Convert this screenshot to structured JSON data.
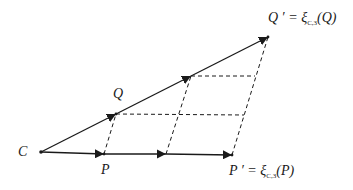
{
  "diagram": {
    "title": "",
    "colors": {
      "stroke": "#1a1a1a",
      "background": "#ffffff"
    },
    "points": {
      "C": {
        "label": "C",
        "x": 41,
        "y": 152
      },
      "P": {
        "label": "P",
        "x": 104,
        "y": 154
      },
      "P2": {
        "label": "",
        "x": 166,
        "y": 154
      },
      "P_prime": {
        "label": "P ′",
        "x": 232,
        "y": 155
      },
      "Q": {
        "label": "Q",
        "x": 116,
        "y": 114
      },
      "Q2": {
        "label": "",
        "x": 191,
        "y": 76
      },
      "Q_prime": {
        "label": "Q ′",
        "x": 268,
        "y": 37
      }
    },
    "labels": {
      "C": "C",
      "P": "P",
      "Q": "Q",
      "P_prime_lhs": "P ′ = ",
      "P_prime_xi": "ξ",
      "P_prime_sub": "C,3",
      "P_prime_arg": "(P)",
      "Q_prime_lhs": "Q ′ = ",
      "Q_prime_xi": "ξ",
      "Q_prime_sub": "C,3",
      "Q_prime_arg": "(Q)"
    },
    "edges": [
      {
        "from": "C",
        "to": "P",
        "style": "solid",
        "arrow": true
      },
      {
        "from": "P",
        "to": "P2",
        "style": "solid",
        "arrow": true
      },
      {
        "from": "P2",
        "to": "P_prime",
        "style": "solid",
        "arrow": true
      },
      {
        "from": "C",
        "to": "Q",
        "style": "solid",
        "arrow": true
      },
      {
        "from": "Q",
        "to": "Q2",
        "style": "solid",
        "arrow": true
      },
      {
        "from": "Q2",
        "to": "Q_prime",
        "style": "solid",
        "arrow": true
      },
      {
        "from": "P",
        "to": "Q",
        "style": "dashed"
      },
      {
        "from": "P2",
        "to": "Q2",
        "style": "dashed"
      },
      {
        "from": "P_prime",
        "to": "Q_prime",
        "style": "dashed"
      },
      {
        "from": "Q",
        "to": "grid_mid_right",
        "style": "dashed"
      },
      {
        "from": "Q2",
        "to": "grid_top_right",
        "style": "dashed"
      }
    ]
  }
}
